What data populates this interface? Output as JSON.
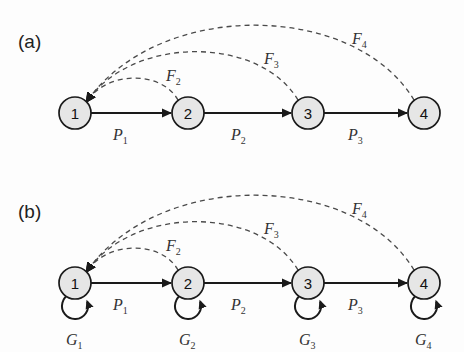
{
  "figure": {
    "background_color": "#fdfdfd",
    "node_fill": "#e6e6e6",
    "node_stroke": "#1a1a1a",
    "solid_edge_color": "#1a1a1a",
    "dashed_edge_color": "#4a4a4a"
  },
  "panels": [
    {
      "id": "panel-a",
      "label": "(a)",
      "label_x": 18,
      "label_y": 48,
      "y_offset": 0,
      "has_self_loops": false,
      "nodes": [
        {
          "id": "n1",
          "label": "1",
          "cx": 75,
          "cy": 113,
          "r": 16
        },
        {
          "id": "n2",
          "label": "2",
          "cx": 188,
          "cy": 113,
          "r": 16
        },
        {
          "id": "n3",
          "label": "3",
          "cx": 308,
          "cy": 113,
          "r": 16
        },
        {
          "id": "n4",
          "label": "4",
          "cx": 424,
          "cy": 113,
          "r": 16
        }
      ],
      "forward_edges": [
        {
          "id": "p1",
          "from": "n1",
          "to": "n2",
          "base": "P",
          "sub": "1",
          "lx": 113,
          "ly": 140
        },
        {
          "id": "p2",
          "from": "n2",
          "to": "n3",
          "base": "P",
          "sub": "2",
          "lx": 231,
          "ly": 140
        },
        {
          "id": "p3",
          "from": "n3",
          "to": "n4",
          "base": "P",
          "sub": "3",
          "lx": 348,
          "ly": 140
        }
      ],
      "feedback_edges": [
        {
          "id": "f2",
          "from": "n2",
          "to": "n1",
          "base": "F",
          "sub": "2",
          "lx": 166,
          "ly": 81
        },
        {
          "id": "f3",
          "from": "n3",
          "to": "n1",
          "base": "F",
          "sub": "3",
          "lx": 264,
          "ly": 64
        },
        {
          "id": "f4",
          "from": "n4",
          "to": "n1",
          "base": "F",
          "sub": "4",
          "lx": 352,
          "ly": 44
        }
      ],
      "self_loops": []
    },
    {
      "id": "panel-b",
      "label": "(b)",
      "label_x": 18,
      "label_y": 218,
      "y_offset": 170,
      "has_self_loops": true,
      "nodes": [
        {
          "id": "n1",
          "label": "1",
          "cx": 75,
          "cy": 283,
          "r": 16
        },
        {
          "id": "n2",
          "label": "2",
          "cx": 188,
          "cy": 283,
          "r": 16
        },
        {
          "id": "n3",
          "label": "3",
          "cx": 308,
          "cy": 283,
          "r": 16
        },
        {
          "id": "n4",
          "label": "4",
          "cx": 424,
          "cy": 283,
          "r": 16
        }
      ],
      "forward_edges": [
        {
          "id": "p1",
          "from": "n1",
          "to": "n2",
          "base": "P",
          "sub": "1",
          "lx": 113,
          "ly": 310
        },
        {
          "id": "p2",
          "from": "n2",
          "to": "n3",
          "base": "P",
          "sub": "2",
          "lx": 231,
          "ly": 310
        },
        {
          "id": "p3",
          "from": "n3",
          "to": "n4",
          "base": "P",
          "sub": "3",
          "lx": 348,
          "ly": 310
        }
      ],
      "feedback_edges": [
        {
          "id": "f2",
          "from": "n2",
          "to": "n1",
          "base": "F",
          "sub": "2",
          "lx": 166,
          "ly": 251
        },
        {
          "id": "f3",
          "from": "n3",
          "to": "n1",
          "base": "F",
          "sub": "3",
          "lx": 264,
          "ly": 234
        },
        {
          "id": "f4",
          "from": "n4",
          "to": "n1",
          "base": "F",
          "sub": "4",
          "lx": 352,
          "ly": 214
        }
      ],
      "self_loops": [
        {
          "id": "g1",
          "node": "n1",
          "base": "G",
          "sub": "1",
          "cx": 75,
          "cy": 306,
          "r": 13,
          "lx": 66,
          "ly": 345
        },
        {
          "id": "g2",
          "node": "n2",
          "base": "G",
          "sub": "2",
          "cx": 188,
          "cy": 306,
          "r": 13,
          "lx": 179,
          "ly": 345
        },
        {
          "id": "g3",
          "node": "n3",
          "base": "G",
          "sub": "3",
          "cx": 308,
          "cy": 306,
          "r": 13,
          "lx": 299,
          "ly": 345
        },
        {
          "id": "g4",
          "node": "n4",
          "base": "G",
          "sub": "4",
          "cx": 424,
          "cy": 306,
          "r": 13,
          "lx": 415,
          "ly": 345
        }
      ]
    }
  ]
}
